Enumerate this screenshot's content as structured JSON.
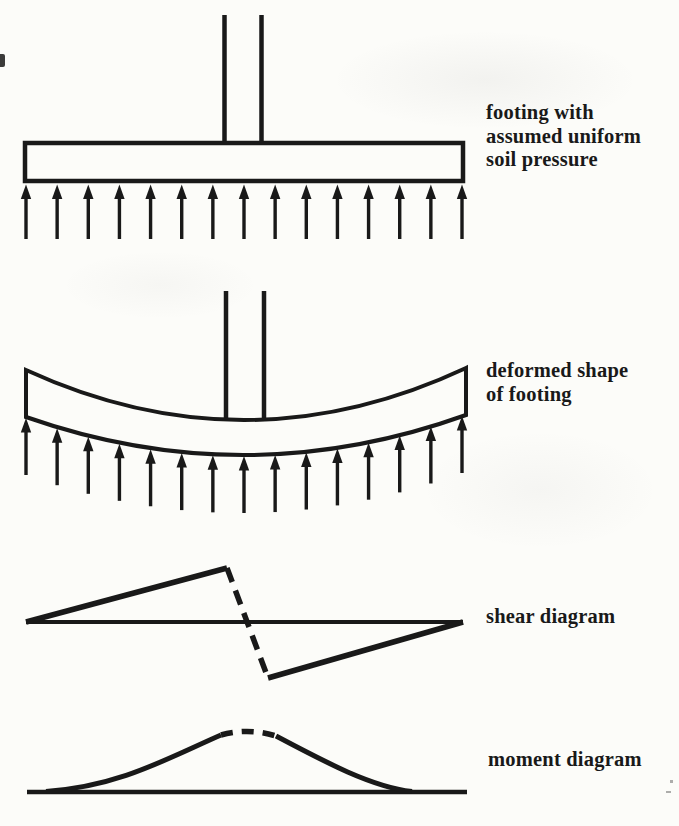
{
  "page": {
    "paper_color": "#fcfcf9",
    "ink_color": "#191919"
  },
  "figures": [
    {
      "id": "footing-uniform-pressure",
      "label_lines": [
        "footing with",
        "assumed uniform",
        "soil pressure"
      ],
      "soil_arrows_count": 15
    },
    {
      "id": "deformed-footing",
      "label_lines": [
        "deformed shape",
        "of footing"
      ],
      "soil_arrows_count": 15
    },
    {
      "id": "shear-diagram",
      "label_lines": [
        "shear diagram"
      ]
    },
    {
      "id": "moment-diagram",
      "label_lines": [
        "moment diagram"
      ]
    }
  ]
}
